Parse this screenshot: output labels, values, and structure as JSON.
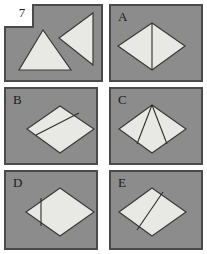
{
  "figure": {
    "question_number": "7",
    "background_color": "#ffffff",
    "panel_fill": "#8c8c8c",
    "panel_border": "#4a4a4a",
    "shape_fill": "#e8e8e4",
    "shape_stroke": "#3a3a3a",
    "fold_line_color": "#2d2d2d"
  },
  "panels": [
    {
      "id": "stimulus",
      "label": "7",
      "label_visible": true,
      "notch": true,
      "description": "Two separate triangles: an upward-pointing isoceles triangle and a left-pointing triangle",
      "shapes": [
        {
          "name": "triangle-up",
          "type": "polygon",
          "points": "43,30 19,70 71,70"
        },
        {
          "name": "triangle-left",
          "type": "polygon",
          "points": "59,38 93,13 93,65"
        }
      ],
      "lines": []
    },
    {
      "id": "A",
      "label": "A",
      "label_visible": true,
      "notch": false,
      "description": "Rhombus divided by one vertical line from top vertex to bottom vertex",
      "shapes": [
        {
          "name": "rhombus",
          "type": "polygon",
          "points": "152,23 185,46 152,70 118,46"
        }
      ],
      "lines": [
        {
          "name": "fold-line-vertical",
          "x1": 152,
          "y1": 23,
          "x2": 152,
          "y2": 70
        }
      ]
    },
    {
      "id": "B",
      "label": "B",
      "label_visible": true,
      "notch": false,
      "description": "Rhombus divided by one diagonal line running lower-left to upper-right",
      "shapes": [
        {
          "name": "rhombus",
          "type": "polygon",
          "points": "60,106 94,129 60,153 27,129"
        }
      ],
      "lines": [
        {
          "name": "fold-line-diagonal",
          "x1": 36,
          "y1": 135,
          "x2": 79,
          "y2": 113
        }
      ]
    },
    {
      "id": "C",
      "label": "C",
      "label_visible": true,
      "notch": false,
      "description": "Rhombus divided by two lines fanning from the top vertex down to the lower edges",
      "shapes": [
        {
          "name": "rhombus",
          "type": "polygon",
          "points": "152,105 186,129 152,153 119,129"
        }
      ],
      "lines": [
        {
          "name": "fold-line-left",
          "x1": 152,
          "y1": 105,
          "x2": 137,
          "y2": 144
        },
        {
          "name": "fold-line-right",
          "x1": 152,
          "y1": 105,
          "x2": 167,
          "y2": 144
        }
      ]
    },
    {
      "id": "D",
      "label": "D",
      "label_visible": true,
      "notch": false,
      "description": "Rhombus with a short vertical line near the left vertex",
      "shapes": [
        {
          "name": "rhombus",
          "type": "polygon",
          "points": "60,188 94,212 60,236 26,212"
        }
      ],
      "lines": [
        {
          "name": "fold-line-vertical-offset",
          "x1": 41,
          "y1": 198,
          "x2": 41,
          "y2": 225
        }
      ]
    },
    {
      "id": "E",
      "label": "E",
      "label_visible": true,
      "notch": false,
      "description": "Rhombus divided by a steep diagonal line from upper-right toward the bottom vertex",
      "shapes": [
        {
          "name": "rhombus",
          "type": "polygon",
          "points": "152,188 186,212 152,236 119,212"
        }
      ],
      "lines": [
        {
          "name": "fold-line-diagonal",
          "x1": 163,
          "y1": 192,
          "x2": 137,
          "y2": 230
        }
      ]
    }
  ]
}
